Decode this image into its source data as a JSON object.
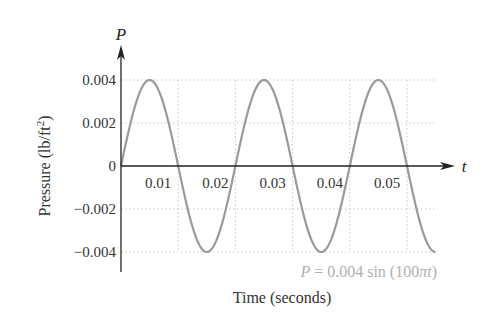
{
  "chart_data": {
    "type": "line",
    "title": "",
    "xlabel": "Time (seconds)",
    "ylabel": "Pressure (lb/ft²)",
    "x_axis_var": "t",
    "y_axis_var": "P",
    "equation_label": "P = 0.004 sin (100πt)",
    "function": {
      "amplitude": 0.004,
      "angular_freq": "100π"
    },
    "x_ticks": [
      "0.01",
      "0.02",
      "0.03",
      "0.04",
      "0.05"
    ],
    "y_ticks": [
      "0.004",
      "0.002",
      "0",
      "−0.002",
      "−0.004"
    ],
    "xlim": [
      0,
      0.055
    ],
    "ylim": [
      -0.004,
      0.004
    ],
    "grid": "dotted",
    "series": [
      {
        "name": "P = 0.004 sin (100πt)",
        "x": [
          0,
          0.005,
          0.01,
          0.015,
          0.02,
          0.025,
          0.03,
          0.035,
          0.04,
          0.045,
          0.05,
          0.055
        ],
        "values": [
          0,
          0.004,
          0,
          -0.004,
          0,
          0.004,
          0,
          -0.004,
          0,
          0.004,
          0,
          -0.004
        ]
      }
    ],
    "colors": {
      "curve": "#9a9a9a",
      "axis": "#222222",
      "grid": "#c8c8c8",
      "equation": "#b0b0b0"
    }
  }
}
